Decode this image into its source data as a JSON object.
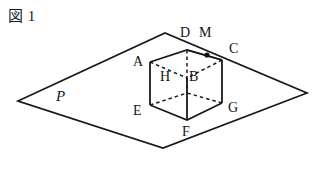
{
  "figure": {
    "caption": "図 1",
    "plane_label": "P",
    "stroke_color": "#1a1a1a",
    "background_color": "#ffffff",
    "vertex_labels": [
      {
        "id": "A",
        "text": "A",
        "x": 133,
        "y": 55
      },
      {
        "id": "D",
        "text": "D",
        "x": 180,
        "y": 26
      },
      {
        "id": "M",
        "text": "M",
        "x": 199,
        "y": 26
      },
      {
        "id": "C",
        "text": "C",
        "x": 229,
        "y": 42
      },
      {
        "id": "H",
        "text": "H",
        "x": 160,
        "y": 70
      },
      {
        "id": "B",
        "text": "B",
        "x": 189,
        "y": 70
      },
      {
        "id": "E",
        "text": "E",
        "x": 133,
        "y": 104
      },
      {
        "id": "F",
        "text": "F",
        "x": 182,
        "y": 125
      },
      {
        "id": "G",
        "text": "G",
        "x": 228,
        "y": 101
      },
      {
        "id": "P",
        "text": "P",
        "x": 56,
        "y": 89
      }
    ],
    "plane_outline": {
      "left": [
        18,
        101
      ],
      "top": [
        165,
        33
      ],
      "right": [
        307,
        93
      ],
      "bottom": [
        163,
        148
      ]
    },
    "cube": {
      "solid_vertices": {
        "A": [
          150,
          62
        ],
        "D": [
          187,
          50
        ],
        "C": [
          222,
          60
        ],
        "E": [
          150,
          105
        ],
        "F": [
          187,
          120
        ],
        "G": [
          222,
          103
        ]
      },
      "hidden_vertices": {
        "B": [
          187,
          78
        ],
        "H_position": [
          187,
          78
        ]
      },
      "point_M": [
        207,
        55
      ]
    }
  }
}
